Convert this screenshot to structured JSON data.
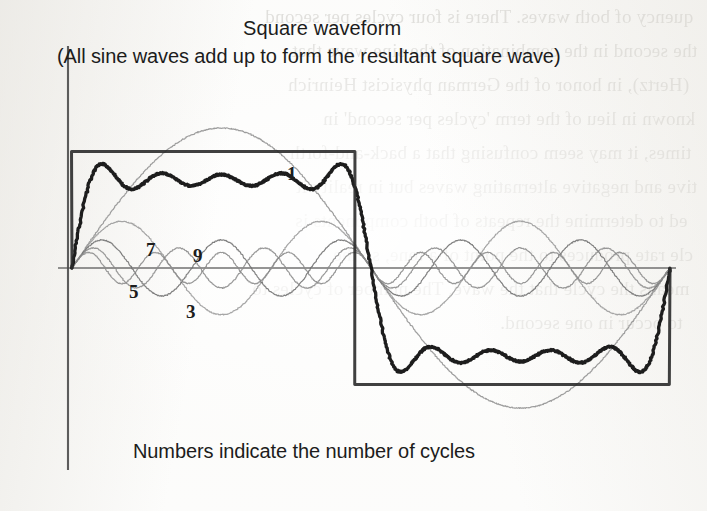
{
  "figure": {
    "title": "Square waveform",
    "subtitle": "(All sine waves add up to form the resultant square wave)",
    "footer": "Numbers indicate the number of cycles"
  },
  "chart_data": {
    "type": "line",
    "title": "Square waveform",
    "subtitle": "(All sine waves add up to form the resultant square wave)",
    "annotation": "Numbers indicate the number of cycles",
    "xlabel": "",
    "ylabel": "",
    "grid": false,
    "legend": "inline-numeric-labels",
    "x_range_cycles": [
      0,
      1
    ],
    "ylim": [
      -1.35,
      1.35
    ],
    "axes": {
      "vertical_axis_x_px": 68,
      "zero_line_y_px": 268,
      "amplitude_px": 140,
      "plot_left_px": 72,
      "plot_right_px": 670,
      "half_period_x_px": 355
    },
    "series": [
      {
        "name": "1",
        "label": "1",
        "harmonic": 1,
        "cycles": 1,
        "amplitude_rel": 1.0,
        "color": "#8f8f8f",
        "width": 1.2,
        "role": "fundamental",
        "label_pos_px": [
          287,
          180
        ]
      },
      {
        "name": "3",
        "label": "3",
        "harmonic": 3,
        "cycles": 3,
        "amplitude_rel": 0.3333,
        "color": "#9a9a9a",
        "width": 1.2,
        "role": "harmonic",
        "label_pos_px": [
          186,
          318
        ]
      },
      {
        "name": "5",
        "label": "5",
        "harmonic": 5,
        "cycles": 5,
        "amplitude_rel": 0.2,
        "color": "#6f6f6f",
        "width": 1.2,
        "role": "harmonic",
        "label_pos_px": [
          129,
          298
        ]
      },
      {
        "name": "7",
        "label": "7",
        "harmonic": 7,
        "cycles": 7,
        "amplitude_rel": 0.1429,
        "color": "#8a8a8a",
        "width": 1.2,
        "role": "harmonic",
        "label_pos_px": [
          146,
          256
        ]
      },
      {
        "name": "9",
        "label": "9",
        "harmonic": 9,
        "cycles": 9,
        "amplitude_rel": 0.1111,
        "color": "#8a8a8a",
        "width": 1.2,
        "role": "harmonic",
        "label_pos_px": [
          193,
          262
        ]
      },
      {
        "name": "resultant",
        "label": "",
        "harmonic": 0,
        "cycles": 0,
        "amplitude_rel": 1.0,
        "color": "#111111",
        "width": 3.2,
        "role": "sum-of-harmonics",
        "label_pos_px": null
      }
    ],
    "harmonic_numbers": [
      1,
      3,
      5,
      7,
      9
    ],
    "square_wave": {
      "levels": [
        1,
        -1
      ],
      "transitions_px": [
        72,
        355,
        670
      ],
      "color": "#2b2b2b",
      "width": 3.0
    }
  },
  "ghost_text": {
    "note": "faint show-through of printed text from the reverse side of the scanned page",
    "left_column": [
      "sity of the wave. Wave 2 is four cycles per",
      "ise, and the four-cycle wave is the",
      "ary) made of the Compendium of Heinrich",
      "not in the form 'cycle' in 1875 here",
      "though it may seem confusing that a",
      "positive and negative alternating waves but in the",
      "need to determine the repeats of both components",
      "to a wave of a distance to each other, so the",
      "means the cycle that the wave. The number of cycles to the",
      "to occur in one second."
    ],
    "right_column": [
      "quency of both waves. There is four cycles per second",
      "the second in the combination of the sine wave that",
      "(Hertz), in honor of the German physicist Heinrich",
      "known in lieu of the term 'cycles per second' in",
      "times, it may seem confusing that a back-and-forth",
      "tive and negative alternating waves but in reality it",
      "ed to determine the repeats of both components is",
      "cle rate produces to the point of a tone, so the",
      "means the cycle that the wave. The number of cycles to",
      "to occur in one second."
    ]
  }
}
